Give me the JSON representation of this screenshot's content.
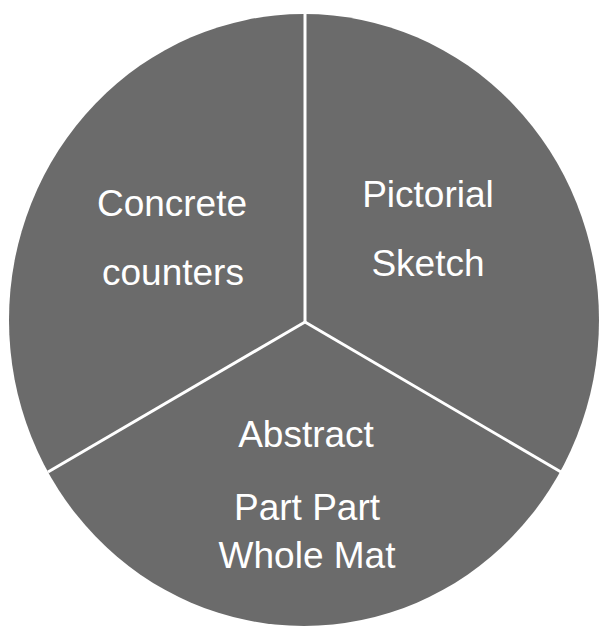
{
  "diagram": {
    "type": "three-sector circle",
    "fill_color": "#6b6b6b",
    "divider_color": "#ffffff",
    "text_color": "#ffffff",
    "sectors": [
      {
        "name": "concrete",
        "lines": [
          "Concrete",
          "counters"
        ]
      },
      {
        "name": "pictorial",
        "lines": [
          "Pictorial",
          "Sketch"
        ]
      },
      {
        "name": "abstract",
        "lines": [
          "Abstract",
          "Part Part",
          "Whole Mat"
        ]
      }
    ]
  }
}
